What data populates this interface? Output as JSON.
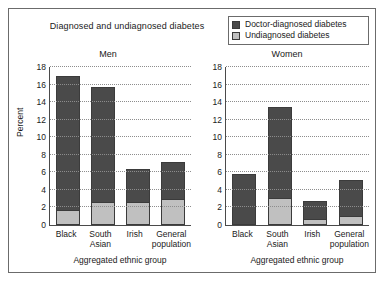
{
  "figure": {
    "title": "Diagnosed and undiagnosed diabetes",
    "ylabel": "Percent"
  },
  "legend": {
    "items": [
      {
        "label": "Doctor-diagnosed diabetes",
        "color": "#4a4a4a"
      },
      {
        "label": "Undiagnosed diabetes",
        "color": "#c0c0c0"
      }
    ]
  },
  "colors": {
    "diagnosed": "#4a4a4a",
    "undiagnosed": "#c0c0c0",
    "outline": "#3b3b3b",
    "axis": "#4a4a4a",
    "grid": "#8d8d8d",
    "frame": "#6b6b6b"
  },
  "ticks": [
    "18",
    "16",
    "14",
    "12",
    "10",
    "8",
    "6",
    "4",
    "2",
    "0"
  ],
  "chart_data": [
    {
      "type": "bar",
      "title": "Men",
      "xlabel": "Aggregated ethnic group",
      "ylabel": "Percent",
      "ylim": [
        0,
        18
      ],
      "ytick_step": 2,
      "grid": true,
      "stacked": true,
      "legend_position": "top-right (shared)",
      "categories": [
        "Black",
        "South Asian",
        "Irish",
        "General population"
      ],
      "series": [
        {
          "name": "Undiagnosed diabetes",
          "values": [
            1.6,
            2.6,
            2.6,
            3.0
          ]
        },
        {
          "name": "Doctor-diagnosed diabetes",
          "values": [
            15.4,
            13.1,
            3.8,
            4.2
          ]
        }
      ],
      "totals": [
        17.0,
        15.7,
        6.4,
        7.2
      ]
    },
    {
      "type": "bar",
      "title": "Women",
      "xlabel": "Aggregated ethnic group",
      "ylabel": "Percent",
      "ylim": [
        0,
        18
      ],
      "ytick_step": 2,
      "grid": true,
      "stacked": true,
      "legend_position": "top-right (shared)",
      "categories": [
        "Black",
        "South Asian",
        "Irish",
        "General population"
      ],
      "series": [
        {
          "name": "Undiagnosed diabetes",
          "values": [
            0.0,
            3.0,
            0.6,
            0.9
          ]
        },
        {
          "name": "Doctor-diagnosed diabetes",
          "values": [
            5.8,
            10.5,
            2.1,
            4.2
          ]
        }
      ],
      "totals": [
        5.8,
        13.5,
        2.7,
        5.1
      ]
    }
  ]
}
